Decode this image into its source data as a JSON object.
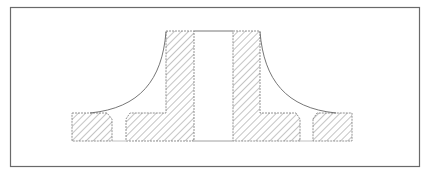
{
  "diagram": {
    "type": "engineering-cross-section",
    "colors": {
      "line": "#555555",
      "hatch": "#8a8a8a",
      "frame": "#6a6a6a",
      "background": "#ffffff"
    },
    "frame": {
      "x": 10,
      "y": 7,
      "width": 410,
      "height": 160
    },
    "parts": [
      {
        "name": "left-flange-segment",
        "section": "hatched"
      },
      {
        "name": "left-hub-wall",
        "section": "hatched"
      },
      {
        "name": "right-hub-wall",
        "section": "hatched"
      },
      {
        "name": "right-flange-segment",
        "section": "hatched"
      },
      {
        "name": "central-bore",
        "section": "open"
      },
      {
        "name": "left-bolt-hole",
        "section": "open"
      },
      {
        "name": "right-bolt-hole",
        "section": "open"
      },
      {
        "name": "left-fillet-curve",
        "section": "outline"
      },
      {
        "name": "right-fillet-curve",
        "section": "outline"
      }
    ]
  }
}
